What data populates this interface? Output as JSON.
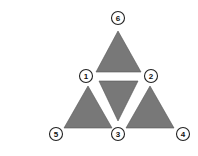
{
  "diagram": {
    "fill_color": "#787878",
    "triangles": [
      {
        "id": "top",
        "points": "118,31 96,72 141,72"
      },
      {
        "id": "middle-inverted",
        "points": "99,81 138,81 118,121"
      },
      {
        "id": "left",
        "points": "88,86 64,128 112,128"
      },
      {
        "id": "right",
        "points": "150,86 126,128 174,128"
      }
    ],
    "nodes": [
      {
        "label": "6",
        "x": 118,
        "y": 18
      },
      {
        "label": "1",
        "x": 86,
        "y": 76
      },
      {
        "label": "2",
        "x": 151,
        "y": 76
      },
      {
        "label": "5",
        "x": 56,
        "y": 134
      },
      {
        "label": "3",
        "x": 118,
        "y": 134
      },
      {
        "label": "4",
        "x": 183,
        "y": 134
      }
    ]
  }
}
